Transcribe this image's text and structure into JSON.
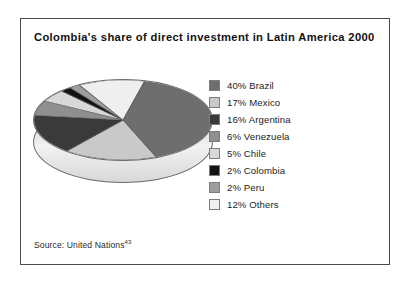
{
  "figure": {
    "title": "Colombia's share of direct investment in Latin America 2000",
    "source_text": "Source: United Nations",
    "source_footnote_marker": "43"
  },
  "chart_data": {
    "type": "pie",
    "title": "Colombia's share of direct investment in Latin America 2000",
    "xlabel": "",
    "ylabel": "",
    "unit": "percent",
    "legend_position": "right",
    "three_d": true,
    "categories": [
      "Brazil",
      "Mexico",
      "Argentina",
      "Venezuela",
      "Chile",
      "Colombia",
      "Peru",
      "Others"
    ],
    "values": [
      40,
      17,
      16,
      6,
      5,
      2,
      2,
      12
    ],
    "labels": [
      "40% Brazil",
      "17% Mexico",
      "16% Argentina",
      "6% Venezuela",
      "5% Chile",
      "2% Colombia",
      "2% Peru",
      "12% Others"
    ],
    "colors": [
      "#6e6e6e",
      "#c9c9c9",
      "#3a3a3a",
      "#8f8f8f",
      "#d8d8d8",
      "#121212",
      "#9e9e9e",
      "#efefef"
    ],
    "total": 100
  }
}
